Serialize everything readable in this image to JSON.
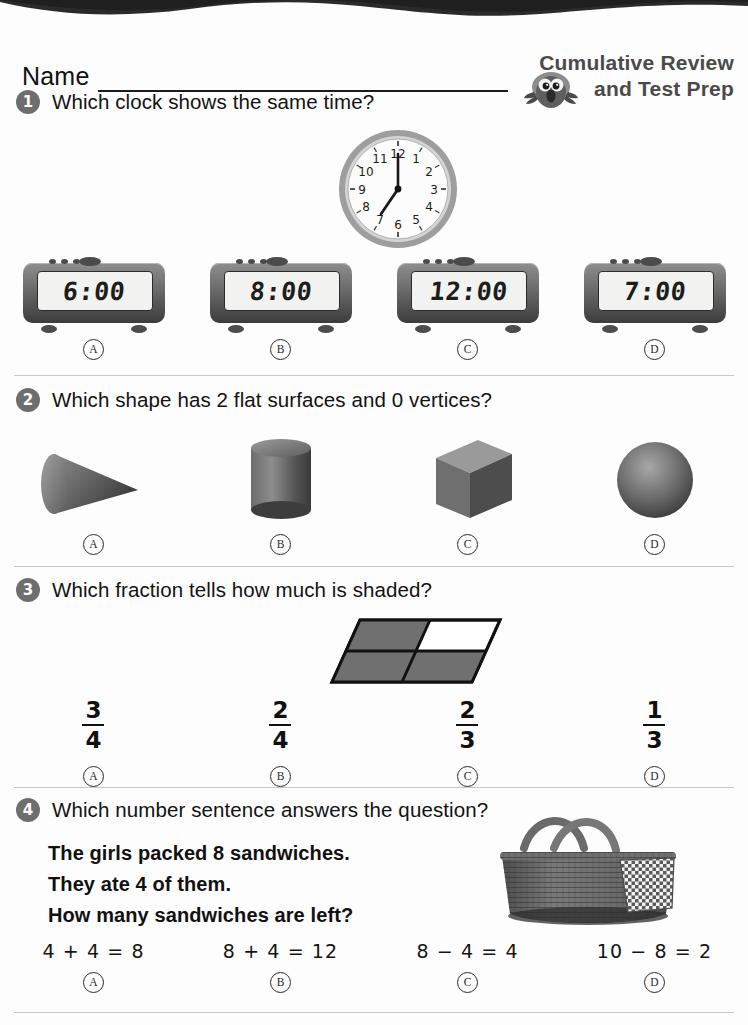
{
  "header": {
    "name_label": "Name",
    "brand_line1": "Cumulative Review",
    "brand_line2": "and Test Prep",
    "mascot_icon": "owl-icon",
    "brand_color": "#4a4a4a"
  },
  "questions": [
    {
      "number": "1",
      "prompt": "Which clock shows the same time?",
      "figure": {
        "type": "analog-clock",
        "time": "7:00",
        "hour_hand": 7,
        "minute_hand": 12
      },
      "choices": [
        {
          "mark": "A",
          "value": "6:00"
        },
        {
          "mark": "B",
          "value": "8:00"
        },
        {
          "mark": "C",
          "value": "12:00"
        },
        {
          "mark": "D",
          "value": "7:00"
        }
      ]
    },
    {
      "number": "2",
      "prompt": "Which shape has 2 flat surfaces and 0 vertices?",
      "choices": [
        {
          "mark": "A",
          "shape": "cone"
        },
        {
          "mark": "B",
          "shape": "cylinder"
        },
        {
          "mark": "C",
          "shape": "cube"
        },
        {
          "mark": "D",
          "shape": "sphere"
        }
      ]
    },
    {
      "number": "3",
      "prompt": "Which fraction tells how much is shaded?",
      "figure": {
        "type": "parallelogram-fraction",
        "total_parts": 4,
        "shaded_parts": 3,
        "unshaded_cell": "top-right"
      },
      "choices": [
        {
          "mark": "A",
          "numerator": "3",
          "denominator": "4"
        },
        {
          "mark": "B",
          "numerator": "2",
          "denominator": "4"
        },
        {
          "mark": "C",
          "numerator": "2",
          "denominator": "3"
        },
        {
          "mark": "D",
          "numerator": "1",
          "denominator": "3"
        }
      ]
    },
    {
      "number": "4",
      "prompt": "Which number sentence answers the question?",
      "word_problem": [
        "The girls packed 8 sandwiches.",
        "They ate 4 of them.",
        "How many sandwiches are left?"
      ],
      "figure": {
        "type": "photo",
        "subject": "picnic-basket"
      },
      "choices": [
        {
          "mark": "A",
          "sentence": "4 + 4 = 8"
        },
        {
          "mark": "B",
          "sentence": "8 + 4 = 12"
        },
        {
          "mark": "C",
          "sentence": "8 − 4 = 4"
        },
        {
          "mark": "D",
          "sentence": "10 − 8 = 2"
        }
      ]
    }
  ],
  "clock_numerals": [
    "12",
    "1",
    "2",
    "3",
    "4",
    "5",
    "6",
    "7",
    "8",
    "9",
    "10",
    "11"
  ]
}
